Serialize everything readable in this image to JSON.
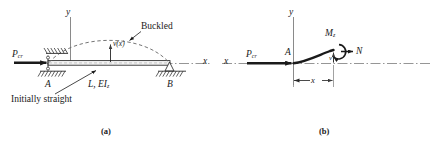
{
  "figure": {
    "width": 434,
    "height": 146,
    "background": "#ffffff",
    "ink": "#1a1a1a",
    "dash_color": "#6e6e6e",
    "axis_color": "#7a7a7a"
  },
  "panel_a": {
    "caption": "(a)",
    "labels": {
      "load": "P",
      "load_sub": "cr",
      "y_axis": "y",
      "x_axis": "x",
      "buckled": "Buckled",
      "deflection": "v(x)",
      "support_left": "A",
      "support_right": "B",
      "beam_props": "L, EI",
      "beam_props_sub": "z",
      "initially_straight": "Initially straight"
    }
  },
  "panel_b": {
    "caption": "(b)",
    "labels": {
      "load": "P",
      "load_sub": "cr",
      "y_axis": "y",
      "x_axis": "x",
      "point_a": "A",
      "moment": "M",
      "moment_sub": "z",
      "normal_force": "N",
      "deflection": "v",
      "distance": "x"
    }
  }
}
